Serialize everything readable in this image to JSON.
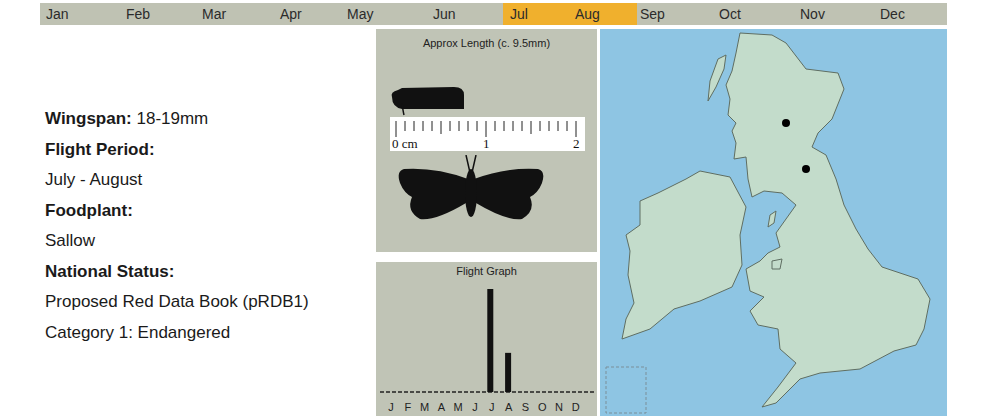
{
  "month_bar": {
    "months": [
      {
        "label": "Jan",
        "x": 6,
        "active": false
      },
      {
        "label": "Feb",
        "x": 86,
        "active": false
      },
      {
        "label": "Mar",
        "x": 162,
        "active": false
      },
      {
        "label": "Apr",
        "x": 240,
        "active": false
      },
      {
        "label": "May",
        "x": 307,
        "active": false
      },
      {
        "label": "Jun",
        "x": 393,
        "active": false
      },
      {
        "label": "Jul",
        "x": 470,
        "active": true
      },
      {
        "label": "Aug",
        "x": 535,
        "active": true
      },
      {
        "label": "Sep",
        "x": 600,
        "active": false
      },
      {
        "label": "Oct",
        "x": 679,
        "active": false
      },
      {
        "label": "Nov",
        "x": 760,
        "active": false
      },
      {
        "label": "Dec",
        "x": 840,
        "active": false
      }
    ],
    "highlight_color": "#f0b02d",
    "base_color": "#bfc2b3"
  },
  "info": {
    "wingspan_label": "Wingspan:",
    "wingspan_value": "18-19mm",
    "flight_period_label": "Flight Period:",
    "flight_period_value": "July - August",
    "foodplant_label": "Foodplant:",
    "foodplant_value": "Sallow",
    "status_label": "National Status:",
    "status_line1": "Proposed Red Data Book (pRDB1)",
    "status_line2": "Category 1: Endangered"
  },
  "length_panel": {
    "title": "Approx Length (c. 9.5mm)",
    "ruler_labels": [
      "0 cm",
      "1",
      "2"
    ]
  },
  "flight_graph": {
    "title": "Flight Graph",
    "month_initials": [
      "J",
      "F",
      "M",
      "A",
      "M",
      "J",
      "J",
      "A",
      "S",
      "O",
      "N",
      "D"
    ]
  },
  "map": {
    "title": "Distribution map of Britain and Ireland",
    "sea_color": "#8ec5e3",
    "land_color": "#c3dccb",
    "records": [
      {
        "x": 186,
        "y": 94
      },
      {
        "x": 206,
        "y": 140
      }
    ]
  },
  "chart_data": {
    "type": "bar",
    "title": "Flight Graph",
    "categories": [
      "J",
      "F",
      "M",
      "A",
      "M",
      "J",
      "J",
      "A",
      "S",
      "O",
      "N",
      "D"
    ],
    "values": [
      0,
      0,
      0,
      0,
      0,
      0,
      100,
      38,
      0,
      0,
      0,
      0
    ],
    "xlabel": "",
    "ylabel": "",
    "ylim": [
      0,
      100
    ],
    "grid": false
  }
}
